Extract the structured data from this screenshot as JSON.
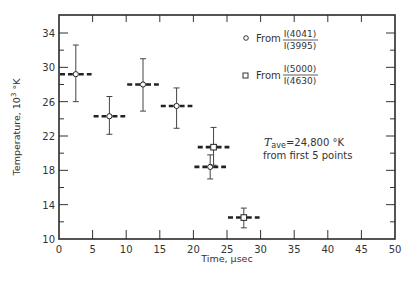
{
  "chart_data": {
    "type": "scatter",
    "title": "",
    "xlabel": "Time, μsec",
    "ylabel": "Temperature, 10³ °K",
    "xlim": [
      0,
      50
    ],
    "ylim": [
      10,
      36
    ],
    "x_ticks": [
      0,
      5,
      10,
      15,
      20,
      25,
      30,
      35,
      40,
      45,
      50
    ],
    "y_ticks": [
      10,
      14,
      18,
      22,
      26,
      30,
      34
    ],
    "y_minor_ticks": [
      12,
      16,
      20,
      24,
      28,
      32,
      36
    ],
    "grid": false,
    "legend_position": "upper right (inside)",
    "series": [
      {
        "name": "From I(4041)/I(3995)",
        "marker": "circle",
        "points": [
          {
            "x": 2.5,
            "y": 29.2,
            "y_err_low": 26.0,
            "y_err_high": 32.6,
            "x_range": [
              0,
              5
            ]
          },
          {
            "x": 7.5,
            "y": 24.3,
            "y_err_low": 22.2,
            "y_err_high": 26.6,
            "x_range": [
              5,
              10
            ]
          },
          {
            "x": 12.5,
            "y": 28.0,
            "y_err_low": 24.9,
            "y_err_high": 31.0,
            "x_range": [
              10,
              15
            ]
          },
          {
            "x": 17.5,
            "y": 25.5,
            "y_err_low": 22.9,
            "y_err_high": 27.6,
            "x_range": [
              15,
              20
            ]
          },
          {
            "x": 22.5,
            "y": 18.4,
            "y_err_low": 17.0,
            "y_err_high": 19.8,
            "x_range": [
              20,
              25
            ]
          }
        ]
      },
      {
        "name": "From I(5000)/I(4630)",
        "marker": "square",
        "points": [
          {
            "x": 23.0,
            "y": 20.7,
            "y_err_low": 18.6,
            "y_err_high": 23.0,
            "x_range": [
              20.5,
              25.5
            ]
          },
          {
            "x": 27.5,
            "y": 12.5,
            "y_err_low": 11.3,
            "y_err_high": 13.6,
            "x_range": [
              25,
              30
            ]
          }
        ]
      }
    ],
    "annotations": [
      "T_ave = 24,800 °K",
      "from first 5 points"
    ]
  },
  "legend": {
    "items": [
      {
        "marker": "circle",
        "prefix": "From",
        "numerator": "I(4041)",
        "denominator": "I(3995)"
      },
      {
        "marker": "square",
        "prefix": "From",
        "numerator": "I(5000)",
        "denominator": "I(4630)"
      }
    ]
  },
  "annotation": {
    "symbol": "T",
    "subscript": "ave",
    "value": "=24,800 °K",
    "line2": "from first 5 points"
  },
  "axes": {
    "xlabel": "Time, μsec",
    "ylabel_main": "Temperature, 10",
    "ylabel_sup": "3",
    "ylabel_unit": " °K"
  }
}
